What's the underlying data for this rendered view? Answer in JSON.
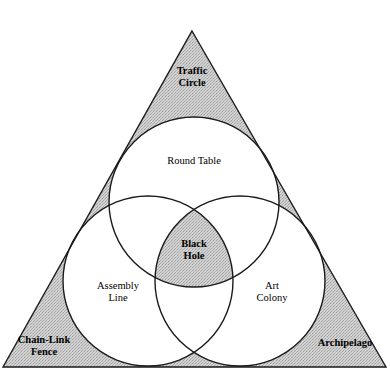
{
  "diagram": {
    "type": "venn-3-circle-in-triangle",
    "title": "Cooperation",
    "width": 390,
    "height": 379,
    "colors": {
      "background": "#ffffff",
      "stroke": "#1a1a1a",
      "shading": "#c9c9c9",
      "text": "#000000"
    },
    "geometry": {
      "triangle": {
        "apex": [
          192,
          31
        ],
        "bottom_left": [
          3,
          367
        ],
        "bottom_right": [
          386,
          367
        ]
      },
      "circles": [
        {
          "name": "top",
          "cx": 194,
          "cy": 202,
          "r": 85
        },
        {
          "name": "left",
          "cx": 148,
          "cy": 281,
          "r": 85
        },
        {
          "name": "right",
          "cx": 240,
          "cy": 281,
          "r": 85
        }
      ]
    },
    "shaded_regions": [
      "triangle-apex-corner",
      "triangle-bottom-left-corner",
      "triangle-bottom-right-corner",
      "triple-intersection"
    ]
  },
  "labels": {
    "title": "Cooperation",
    "apex_corner": "Traffic\nCircle",
    "top_circle": "Round Table",
    "center": "Black\nHole",
    "left_circle": "Assembly\nLine",
    "right_circle": "Art\nColony",
    "bottom_left_corner": "Chain-Link\nFence",
    "bottom_right_corner": "Archipelago"
  }
}
